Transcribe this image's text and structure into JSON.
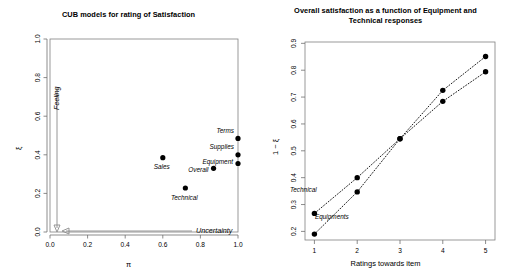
{
  "figure": {
    "panels": [
      {
        "id": "cub-scatter",
        "title": "CUB models for rating of Satisfaction"
      },
      {
        "id": "satisfaction-lines",
        "title": "Overall satisfaction as a function of Equipment and Technical responses"
      }
    ]
  },
  "left": {
    "title": "CUB models for rating of Satisfaction",
    "xlabel": "π",
    "ylabel": "ξ",
    "xticks": [
      "0.0",
      "0.2",
      "0.4",
      "0.6",
      "0.8",
      "1.0"
    ],
    "yticks": [
      "0.0",
      "0.2",
      "0.4",
      "0.6",
      "0.8",
      "1.0"
    ],
    "annotations": {
      "feeling": "Feeling",
      "uncertainty": "Uncertainty"
    },
    "points": [
      {
        "label": "Sales",
        "pi": 0.6,
        "xi": 0.385
      },
      {
        "label": "Technical",
        "pi": 0.72,
        "xi": 0.228
      },
      {
        "label": "Overall",
        "pi": 0.87,
        "xi": 0.33
      },
      {
        "label": "Equipment",
        "pi": 1.0,
        "xi": 0.355
      },
      {
        "label": "Supplies",
        "pi": 1.0,
        "xi": 0.4
      },
      {
        "label": "Terms",
        "pi": 1.0,
        "xi": 0.485
      }
    ]
  },
  "right": {
    "title_line1": "Overall satisfaction as a function of Equipment and",
    "title_line2": "Technical responses",
    "xlabel": "Ratings towards item",
    "ylabel": "1 − ξ",
    "xticks": [
      "1",
      "2",
      "3",
      "4",
      "5"
    ],
    "yticks": [
      "0.2",
      "0.3",
      "0.4",
      "0.5",
      "0.6",
      "0.7",
      "0.8",
      "0.9"
    ],
    "series_labels": {
      "technical": "Technical",
      "equipments": "Equipments"
    }
  },
  "chart_data": [
    {
      "type": "scatter",
      "title": "CUB models for rating of Satisfaction",
      "xlabel": "π",
      "ylabel": "ξ",
      "xlim": [
        0.0,
        1.0
      ],
      "ylim": [
        0.0,
        1.0
      ],
      "grid": false,
      "legend": "none",
      "point_labels": [
        "Sales",
        "Technical",
        "Overall",
        "Equipment",
        "Supplies",
        "Terms"
      ],
      "x": [
        0.6,
        0.72,
        0.87,
        1.0,
        1.0,
        1.0
      ],
      "y": [
        0.385,
        0.228,
        0.33,
        0.355,
        0.4,
        0.485
      ],
      "annotations": [
        {
          "text": "Feeling",
          "direction": "down-along-y-axis"
        },
        {
          "text": "Uncertainty",
          "direction": "left-along-x-axis"
        }
      ]
    },
    {
      "type": "line",
      "title": "Overall satisfaction as a function of Equipment and Technical responses",
      "xlabel": "Ratings towards item",
      "ylabel": "1 − ξ",
      "xlim": [
        1,
        5
      ],
      "ylim": [
        0.17,
        0.9
      ],
      "grid": false,
      "legend": "inline-labels",
      "categories": [
        1,
        2,
        3,
        4,
        5
      ],
      "series": [
        {
          "name": "Technical",
          "values": [
            0.267,
            0.4,
            0.545,
            0.725,
            0.851
          ],
          "style": "dotted"
        },
        {
          "name": "Equipments",
          "values": [
            0.19,
            0.347,
            0.545,
            0.684,
            0.794
          ],
          "style": "dotted"
        }
      ]
    }
  ]
}
